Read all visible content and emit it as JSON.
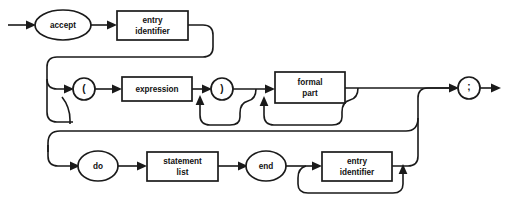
{
  "diagram": {
    "type": "railroad-syntax-diagram",
    "colors": {
      "background": "#ffffff",
      "stroke": "#1a1a1a",
      "node_fill": "#ffffff",
      "text": "#111111"
    },
    "nodes": [
      {
        "id": "accept",
        "shape": "oval",
        "label": "accept",
        "cx": 63,
        "cy": 25
      },
      {
        "id": "entry_id_1",
        "shape": "box",
        "label": "entry\nidentifier",
        "line1": "entry",
        "line2": "identifier",
        "x": 117,
        "y": 11,
        "w": 71,
        "h": 29
      },
      {
        "id": "lparen",
        "shape": "circle",
        "label": "(",
        "cx": 84,
        "cy": 89
      },
      {
        "id": "expression",
        "shape": "box",
        "label": "expression",
        "line1": "expression",
        "line2": "",
        "x": 122,
        "y": 77,
        "w": 70,
        "h": 24
      },
      {
        "id": "rparen",
        "shape": "circle",
        "label": ")",
        "cx": 222,
        "cy": 89
      },
      {
        "id": "formal_part",
        "shape": "box",
        "label": "formal\npart",
        "line1": "formal",
        "line2": "part",
        "x": 275,
        "y": 72,
        "w": 70,
        "h": 31
      },
      {
        "id": "semicolon",
        "shape": "circle",
        "label": ";",
        "cx": 469,
        "cy": 88
      },
      {
        "id": "do",
        "shape": "oval",
        "label": "do",
        "cx": 98,
        "cy": 166
      },
      {
        "id": "statement_list",
        "shape": "box",
        "label": "statement\nlist",
        "line1": "statement",
        "line2": "list",
        "x": 147,
        "y": 152,
        "w": 71,
        "h": 29
      },
      {
        "id": "end",
        "shape": "oval",
        "label": "end",
        "cx": 266,
        "cy": 166
      },
      {
        "id": "entry_id_2",
        "shape": "box",
        "label": "entry\nidentifier",
        "line1": "entry",
        "line2": "identifier",
        "x": 322,
        "y": 152,
        "w": 70,
        "h": 29
      }
    ],
    "labels": {
      "accept": "accept",
      "entry": "entry",
      "identifier": "identifier",
      "lparen": "(",
      "expression": "expression",
      "rparen": ")",
      "formal": "formal",
      "part": "part",
      "semicolon": ";",
      "do": "do",
      "statement": "statement",
      "list": "list",
      "end": "end"
    }
  }
}
